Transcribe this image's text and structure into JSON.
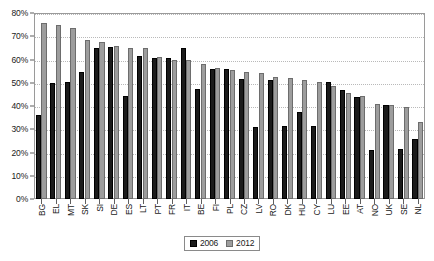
{
  "chart_data": {
    "type": "bar",
    "title": "",
    "subtitle": "",
    "xlabel": "",
    "ylabel": "",
    "ylim": [
      0,
      80
    ],
    "ytick_labels": [
      "0%",
      "10%",
      "20%",
      "30%",
      "40%",
      "50%",
      "60%",
      "70%",
      "80%"
    ],
    "ytick_values": [
      0,
      10,
      20,
      30,
      40,
      50,
      60,
      70,
      80
    ],
    "grid": true,
    "grid_style": "dotted-horizontal",
    "legend_position": "bottom-center",
    "categories": [
      "BG",
      "EL",
      "MT",
      "SK",
      "SI",
      "DE",
      "ES",
      "LT",
      "PT",
      "FR",
      "IT",
      "BE",
      "FI",
      "PL",
      "CZ",
      "LV",
      "RO",
      "DK",
      "HU",
      "CY",
      "LU",
      "EE",
      "AT",
      "NO",
      "UK",
      "SE",
      "NL"
    ],
    "series": [
      {
        "name": "2006",
        "color": "#1b1b1b",
        "values": [
          36.0,
          50.0,
          50.5,
          54.5,
          65.0,
          65.5,
          44.5,
          61.5,
          60.5,
          60.5,
          65.0,
          47.5,
          56.0,
          56.0,
          51.5,
          31.0,
          51.0,
          31.5,
          37.5,
          31.5,
          50.5,
          47.0,
          44.0,
          21.0,
          40.5,
          21.5,
          26.0
        ]
      },
      {
        "name": "2012",
        "color": "#9d9d9d",
        "values": [
          75.5,
          75.0,
          73.5,
          68.5,
          67.5,
          66.0,
          65.0,
          65.0,
          61.0,
          60.0,
          60.0,
          58.0,
          56.5,
          55.5,
          54.5,
          54.0,
          52.5,
          52.0,
          51.0,
          50.5,
          48.5,
          45.5,
          44.5,
          41.0,
          40.5,
          39.5,
          33.0
        ]
      }
    ]
  },
  "legend": {
    "entries": [
      {
        "label": "2006"
      },
      {
        "label": "2012"
      }
    ]
  }
}
